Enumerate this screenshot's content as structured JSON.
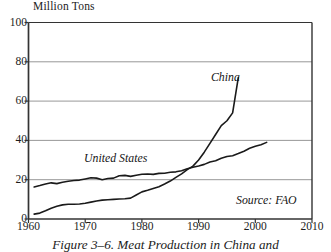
{
  "figure": {
    "caption": "Figure 3–6. Meat Production in China and",
    "source_note": "Source: FAO"
  },
  "chart_data": {
    "type": "line",
    "title": "Million Tons",
    "xlabel": "",
    "ylabel": "Million Tons",
    "xlim": [
      1960,
      2010
    ],
    "ylim": [
      0,
      100
    ],
    "yticks": [
      0,
      20,
      40,
      60,
      80,
      100
    ],
    "xticks": [
      1960,
      1970,
      1980,
      1990,
      2000,
      2010
    ],
    "grid": "horizontal",
    "legend": "inline-annotations",
    "annotations": [
      "China",
      "United States",
      "Source: FAO"
    ],
    "series": [
      {
        "name": "China",
        "x": [
          1961,
          1962,
          1963,
          1964,
          1965,
          1966,
          1967,
          1968,
          1969,
          1970,
          1971,
          1972,
          1973,
          1974,
          1975,
          1976,
          1977,
          1978,
          1979,
          1980,
          1981,
          1982,
          1983,
          1984,
          1985,
          1986,
          1987,
          1988,
          1989,
          1990,
          1991,
          1992,
          1993,
          1994,
          1995,
          1996,
          1997
        ],
        "values": [
          2.5,
          3.0,
          4.2,
          5.5,
          6.5,
          7.2,
          7.5,
          7.5,
          7.6,
          8.0,
          8.6,
          9.2,
          9.6,
          9.8,
          10.0,
          10.2,
          10.3,
          10.6,
          12.2,
          13.8,
          14.6,
          15.5,
          16.4,
          17.8,
          19.3,
          21.2,
          23.0,
          25.1,
          26.9,
          30.0,
          34.0,
          38.5,
          43.0,
          47.5,
          50.0,
          54.0,
          72.0
        ]
      },
      {
        "name": "United States",
        "x": [
          1961,
          1962,
          1963,
          1964,
          1965,
          1966,
          1967,
          1968,
          1969,
          1970,
          1971,
          1972,
          1973,
          1974,
          1975,
          1976,
          1977,
          1978,
          1979,
          1980,
          1981,
          1982,
          1983,
          1984,
          1985,
          1986,
          1987,
          1988,
          1989,
          1990,
          1991,
          1992,
          1993,
          1994,
          1995,
          1996,
          1997,
          1998,
          1999,
          2000,
          2001,
          2002
        ],
        "values": [
          16.3,
          17.0,
          17.8,
          18.4,
          18.0,
          18.7,
          19.2,
          19.6,
          19.8,
          20.4,
          21.0,
          20.8,
          20.0,
          20.6,
          20.8,
          22.0,
          22.2,
          21.7,
          22.3,
          22.8,
          22.9,
          22.7,
          23.2,
          23.3,
          23.8,
          24.0,
          24.6,
          25.6,
          26.3,
          27.0,
          27.8,
          29.0,
          29.6,
          30.9,
          31.8,
          32.2,
          33.3,
          34.5,
          36.0,
          37.0,
          37.8,
          39.0
        ]
      }
    ]
  },
  "yaxis": {
    "ticks": [
      {
        "label": "100",
        "value": 100
      },
      {
        "label": "80",
        "value": 80
      },
      {
        "label": "60",
        "value": 60
      },
      {
        "label": "40",
        "value": 40
      },
      {
        "label": "20",
        "value": 20
      },
      {
        "label": "0",
        "value": 0
      }
    ]
  },
  "xaxis": {
    "ticks": [
      {
        "label": "1960",
        "value": 1960
      },
      {
        "label": "1970",
        "value": 1970
      },
      {
        "label": "1980",
        "value": 1980
      },
      {
        "label": "1990",
        "value": 1990
      },
      {
        "label": "2000",
        "value": 2000
      },
      {
        "label": "2010",
        "value": 2010
      }
    ]
  },
  "colors": {
    "background": "#ffffff",
    "axis": "#333333",
    "gridline": "#8c8c8c",
    "line": "#1a1a1a",
    "text": "#1c1c1c"
  }
}
